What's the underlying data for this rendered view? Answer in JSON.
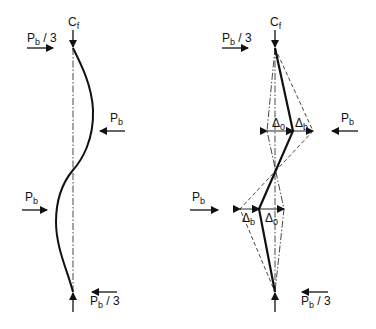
{
  "figure": {
    "left_panel": {
      "top_load": {
        "symbol": "C",
        "subscript": "f"
      },
      "top_force": {
        "symbol": "P",
        "subscript": "b",
        "suffix": " / 3",
        "direction": "right"
      },
      "mid_upper_force": {
        "symbol": "P",
        "subscript": "b",
        "suffix": "",
        "direction": "left"
      },
      "mid_lower_force": {
        "symbol": "P",
        "subscript": "b",
        "suffix": "",
        "direction": "right"
      },
      "bottom_force": {
        "symbol": "P",
        "subscript": "b",
        "suffix": " / 3",
        "direction": "left"
      },
      "shape": "double-curvature sine wave"
    },
    "right_panel": {
      "top_load": {
        "symbol": "C",
        "subscript": "f"
      },
      "top_force": {
        "symbol": "P",
        "subscript": "b",
        "suffix": " / 3",
        "direction": "right"
      },
      "mid_upper_force": {
        "symbol": "P",
        "subscript": "b",
        "suffix": "",
        "direction": "left"
      },
      "mid_lower_force": {
        "symbol": "P",
        "subscript": "b",
        "suffix": "",
        "direction": "right"
      },
      "bottom_force": {
        "symbol": "P",
        "subscript": "b",
        "suffix": " / 3",
        "direction": "left"
      },
      "upper_dims": [
        {
          "symbol": "Δ",
          "subscript": "0"
        },
        {
          "symbol": "Δ",
          "subscript": "b"
        }
      ],
      "lower_dims": [
        {
          "symbol": "Δ",
          "subscript": "b"
        },
        {
          "symbol": "Δ",
          "subscript": "0"
        }
      ],
      "shape": "piecewise-linear with initial imperfection"
    },
    "colors": {
      "line": "#111111",
      "dash": "#333333",
      "bg": "#ffffff"
    }
  }
}
